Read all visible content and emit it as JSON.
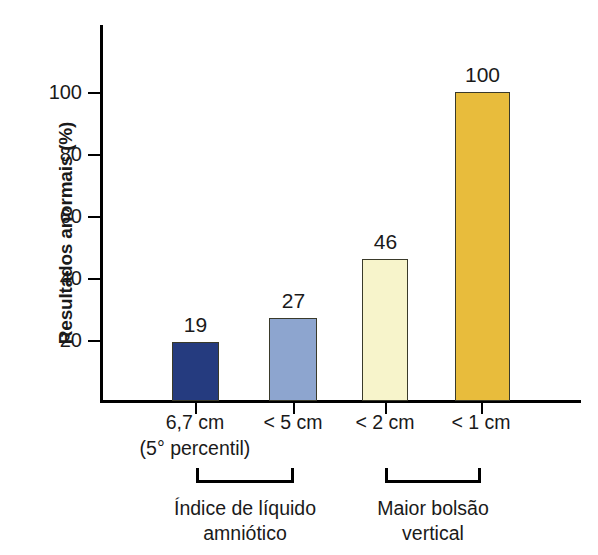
{
  "chart_data": {
    "type": "bar",
    "title": "",
    "xlabel": "",
    "ylabel": "Resultados anormais (%)",
    "categories": [
      "6,7 cm",
      "< 5 cm",
      "< 2 cm",
      "< 1 cm"
    ],
    "category_sublabels": [
      "(5° percentil)",
      "",
      "",
      ""
    ],
    "values": [
      19,
      27,
      46,
      100
    ],
    "value_labels": [
      "19",
      "27",
      "46",
      "100"
    ],
    "bar_colors": [
      "#253b7f",
      "#8da5cf",
      "#f7f4cb",
      "#e8bc3c"
    ],
    "ylim": [
      0,
      115
    ],
    "yticks": [
      20,
      40,
      60,
      80,
      100
    ],
    "ytick_labels": [
      "20",
      "40",
      "60",
      "80",
      "100"
    ],
    "grid": false,
    "legend": "none",
    "groups": [
      {
        "label_line1": "Índice de líquido",
        "label_line2": "amniótico",
        "members": [
          "6,7 cm",
          "< 5 cm"
        ]
      },
      {
        "label_line1": "Maior bolsão",
        "label_line2": "vertical",
        "members": [
          "< 2 cm",
          "< 1 cm"
        ]
      }
    ]
  }
}
